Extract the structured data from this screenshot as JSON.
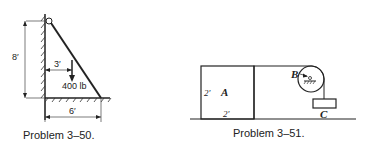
{
  "figures": [
    {
      "caption": "Problem 3–50.",
      "labels": {
        "height": "8′",
        "load_offset": "3′",
        "load": "400 lb",
        "base": "6′"
      }
    },
    {
      "caption": "Problem 3–51.",
      "labels": {
        "block_height": "2′",
        "block_name": "A",
        "block_width": "2′",
        "pulley": "B",
        "weight": "C"
      }
    }
  ]
}
